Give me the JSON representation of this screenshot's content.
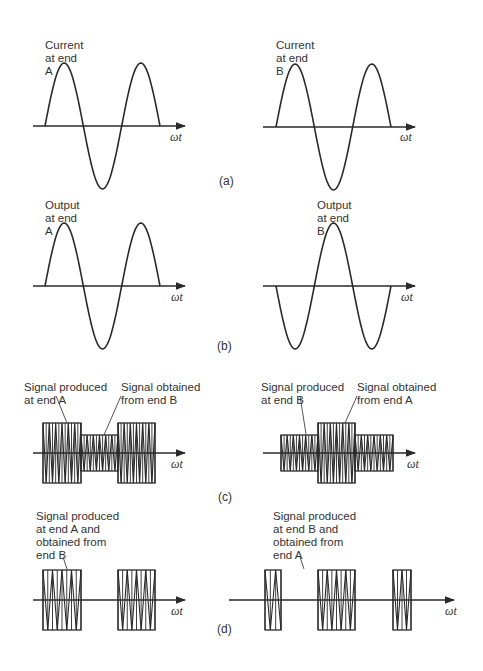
{
  "figure": {
    "panels": [
      {
        "id": "a",
        "label": "(a)",
        "left": {
          "caption": "Current\nat end\nA",
          "waveform": "sine",
          "phase": "positive-first",
          "cycles": 1.5
        },
        "right": {
          "caption": "Current\nat end\nB",
          "waveform": "sine",
          "phase": "positive-first",
          "cycles": 1.5
        }
      },
      {
        "id": "b",
        "label": "(b)",
        "left": {
          "caption": "Output\nat end\nA",
          "waveform": "sine",
          "phase": "positive-first",
          "cycles": 1.5
        },
        "right": {
          "caption": "Output\nat end\nB",
          "waveform": "sine",
          "phase": "negative-first",
          "cycles": 1.5
        }
      },
      {
        "id": "c",
        "label": "(c)",
        "left": {
          "annotations": [
            "Signal produced\nat end A",
            "Signal obtained\nfrom end B"
          ],
          "bursts": [
            {
              "segment": 1,
              "amplitude": "large"
            },
            {
              "segment": 2,
              "amplitude": "small"
            },
            {
              "segment": 3,
              "amplitude": "large"
            }
          ]
        },
        "right": {
          "annotations": [
            "Signal produced\nat end B",
            "Signal obtained\nfrom end A"
          ],
          "bursts": [
            {
              "segment": 1,
              "amplitude": "small"
            },
            {
              "segment": 2,
              "amplitude": "large"
            },
            {
              "segment": 3,
              "amplitude": "small"
            }
          ]
        }
      },
      {
        "id": "d",
        "label": "(d)",
        "left": {
          "annotation": "Signal produced\nat end A and\nobtained from\nend B",
          "bursts": [
            {
              "segment": 1,
              "amplitude": "large"
            },
            {
              "segment": 2,
              "amplitude": "none"
            },
            {
              "segment": 3,
              "amplitude": "large"
            }
          ]
        },
        "right": {
          "annotation": "Signal produced\nat end B and\nobtained from\nend A",
          "bursts": [
            {
              "segment": 0.5,
              "amplitude": "large-partial"
            },
            {
              "segment": 1,
              "amplitude": "none"
            },
            {
              "segment": 2,
              "amplitude": "large"
            },
            {
              "segment": 3,
              "amplitude": "none"
            },
            {
              "segment": 3.5,
              "amplitude": "large-partial"
            }
          ]
        }
      }
    ],
    "axis_label": "ωt"
  },
  "labels": {
    "a_left": "Current\nat end\nA",
    "a_right": "Current\nat end\nB",
    "b_left": "Output\nat end\nA",
    "b_right": "Output\nat end\nB",
    "c_left_1": "Signal produced\nat end A",
    "c_left_2": "Signal obtained\nfrom end B",
    "c_right_1": "Signal produced\nat end B",
    "c_right_2": "Signal obtained\nfrom end A",
    "d_left": "Signal produced\nat end A and\nobtained from\nend B",
    "d_right": "Signal produced\nat end B and\nobtained from\nend A",
    "axis": "ωt",
    "panel_a": "(a)",
    "panel_b": "(b)",
    "panel_c": "(c)",
    "panel_d": "(d)"
  },
  "colors": {
    "stroke": "#2a2a2a",
    "background": "#ffffff"
  }
}
